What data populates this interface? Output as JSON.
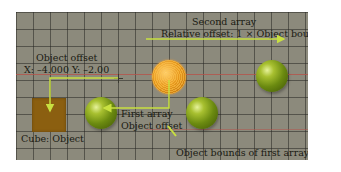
{
  "diagram": {
    "labels": {
      "second_array_title": "Second array",
      "second_array_offset": "Relative offset: 1 × Object bounds",
      "object_offset_title": "Object offset",
      "object_offset_coords": "X: –4.000 Y: –2.00",
      "cube_label": "Cube: Object",
      "first_array_title": "First array",
      "first_array_offset": "Object offset",
      "object_bounds_label": "Object bounds of first array"
    },
    "objects": [
      {
        "name": "cube",
        "type": "cube",
        "color": "#8b5f10"
      },
      {
        "name": "selected-sphere",
        "type": "sphere",
        "state": "selected",
        "color": "#e89a20"
      },
      {
        "name": "first-array-sphere-left",
        "type": "sphere",
        "color": "#8aa820"
      },
      {
        "name": "first-array-sphere-right",
        "type": "sphere",
        "color": "#8aa820"
      },
      {
        "name": "second-array-sphere",
        "type": "sphere",
        "color": "#8aa820"
      }
    ],
    "colors": {
      "background": "#8c8a7c",
      "grid": "#2a2a23",
      "arrow": "#c8e040",
      "guide_line": "#b5524a",
      "text": "#1a1a12"
    }
  }
}
